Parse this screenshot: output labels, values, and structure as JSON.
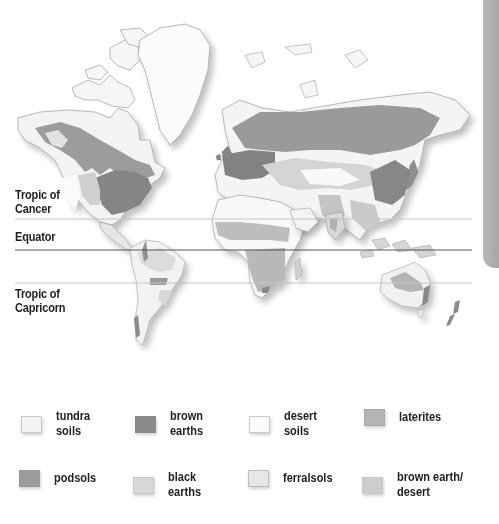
{
  "map": {
    "title": "World soil types",
    "latitude_lines": [
      {
        "label": "Tropic of\nCancer",
        "y": 219
      },
      {
        "label": "Equator",
        "y": 250
      },
      {
        "label": "Tropic of\nCapricorn",
        "y": 283
      }
    ]
  },
  "labels": {
    "tropic_cancer_1": "Tropic of",
    "tropic_cancer_2": "Cancer",
    "equator": "Equator",
    "tropic_capricorn_1": "Tropic of",
    "tropic_capricorn_2": "Capricorn"
  },
  "legend": {
    "items": [
      {
        "label": "tundra\nsoils",
        "color": "#f4f4f4"
      },
      {
        "label": "brown\nearths",
        "color": "#8a8a8a"
      },
      {
        "label": "desert\nsoils",
        "color": "#fbfbfb"
      },
      {
        "label": "laterites",
        "color": "#b4b4b4"
      },
      {
        "label": "podsols",
        "color": "#9c9c9c"
      },
      {
        "label": "black\nearths",
        "color": "#d8d8d8"
      },
      {
        "label": "ferralsols",
        "color": "#e6e6e6"
      },
      {
        "label": "brown earth/\ndesert",
        "color": "#cdcdcd"
      }
    ]
  },
  "colors": {
    "tundra": "#f4f4f4",
    "brown_earths": "#8a8a8a",
    "desert": "#fbfbfb",
    "laterites": "#b4b4b4",
    "podsols": "#9c9c9c",
    "black_earths": "#d8d8d8",
    "ferralsols": "#e6e6e6",
    "brown_earth_desert": "#cdcdcd",
    "outline": "#8c8c8c",
    "tab": "#ababab"
  }
}
